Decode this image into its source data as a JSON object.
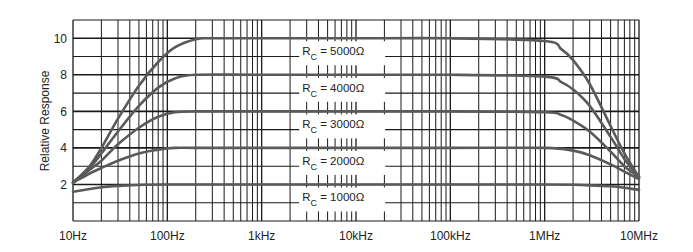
{
  "chart_data": {
    "type": "line",
    "title": "",
    "xlabel": "",
    "ylabel": "Relative Response",
    "xscale": "log",
    "xlim": [
      10,
      10000000
    ],
    "ylim": [
      0,
      11
    ],
    "grid": true,
    "x_ticks": [
      10,
      100,
      1000,
      10000,
      100000,
      1000000,
      10000000
    ],
    "x_tick_labels": [
      "10Hz",
      "100Hz",
      "1kHz",
      "10kHz",
      "100kHz",
      "1MHz",
      "10MHz"
    ],
    "y_ticks": [
      2,
      4,
      6,
      8,
      10
    ],
    "y_tick_labels": [
      "2",
      "4",
      "6",
      "8",
      "10"
    ],
    "legend": "inline labels",
    "series": [
      {
        "name": "RC = 5000Ω",
        "label_main": "R",
        "label_sub": "C",
        "label_rest": "= 5000Ω",
        "x": [
          10,
          15,
          20,
          30,
          50,
          80,
          120,
          200,
          300,
          1000,
          10000,
          100000,
          1000000,
          1500000,
          2000000,
          3000000,
          5000000,
          7000000,
          10000000
        ],
        "values": [
          2.1,
          3.0,
          4.0,
          5.6,
          7.4,
          8.7,
          9.5,
          9.95,
          10.0,
          10.0,
          10.0,
          10.0,
          9.85,
          9.4,
          8.8,
          7.5,
          5.2,
          3.7,
          2.4
        ]
      },
      {
        "name": "RC = 4000Ω",
        "label_main": "R",
        "label_sub": "C",
        "label_rest": "= 4000Ω",
        "x": [
          10,
          15,
          20,
          30,
          50,
          80,
          120,
          200,
          1000,
          10000,
          100000,
          1000000,
          1500000,
          2000000,
          3000000,
          5000000,
          7000000,
          10000000
        ],
        "values": [
          2.1,
          2.9,
          3.7,
          4.9,
          6.3,
          7.3,
          7.8,
          8.0,
          8.0,
          8.0,
          8.0,
          7.9,
          7.6,
          7.2,
          6.3,
          4.6,
          3.4,
          2.4
        ]
      },
      {
        "name": "RC = 3000Ω",
        "label_main": "R",
        "label_sub": "C",
        "label_rest": "= 3000Ω",
        "x": [
          10,
          15,
          20,
          30,
          50,
          80,
          120,
          200,
          1000,
          10000,
          100000,
          1000000,
          1500000,
          2000000,
          3000000,
          5000000,
          7000000,
          10000000
        ],
        "values": [
          2.1,
          2.8,
          3.3,
          4.2,
          5.1,
          5.7,
          5.95,
          6.0,
          6.0,
          6.0,
          6.0,
          5.95,
          5.8,
          5.5,
          4.9,
          3.8,
          3.0,
          2.4
        ]
      },
      {
        "name": "RC = 2000Ω",
        "label_main": "R",
        "label_sub": "C",
        "label_rest": "= 2000Ω",
        "x": [
          10,
          15,
          20,
          30,
          50,
          80,
          120,
          200,
          1000,
          10000,
          100000,
          1000000,
          2000000,
          3000000,
          5000000,
          7000000,
          10000000
        ],
        "values": [
          2.1,
          2.6,
          2.9,
          3.3,
          3.7,
          3.9,
          4.0,
          4.0,
          4.0,
          4.0,
          4.0,
          4.0,
          3.85,
          3.6,
          3.1,
          2.7,
          2.3
        ]
      },
      {
        "name": "RC = 1000Ω",
        "label_main": "R",
        "label_sub": "C",
        "label_rest": "= 1000Ω",
        "x": [
          10,
          15,
          20,
          30,
          50,
          100,
          1000,
          10000,
          100000,
          1000000,
          2000000,
          3000000,
          5000000,
          7000000,
          10000000
        ],
        "values": [
          1.6,
          1.75,
          1.85,
          1.92,
          1.97,
          2.0,
          2.0,
          2.0,
          2.0,
          2.0,
          1.98,
          1.95,
          1.9,
          1.82,
          1.7
        ]
      }
    ],
    "label_positions_y": [
      10,
      8,
      6,
      4,
      2
    ],
    "colors": {
      "grid": "#1a1a1a",
      "curve": "#5a5a5a",
      "text": "#222222",
      "background": "#ffffff"
    }
  }
}
